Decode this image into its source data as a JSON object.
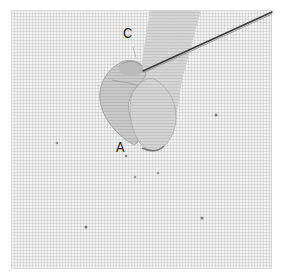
{
  "image": {
    "description": "Ribbon embroidery step: ribbon looped on fabric with needle inserted near point C",
    "width": 283,
    "height": 275
  },
  "labels": {
    "c": "C",
    "a": "A"
  },
  "colors": {
    "fabric": "#f3f3f3",
    "ribbon": "#c4c4c4",
    "ribbon_shadow": "#9a9a9a",
    "needle": "#3a3a3a",
    "label": "#1a1a1a",
    "dot": "#8a8a8a"
  },
  "marker_dots": [
    {
      "x": 57,
      "y": 143
    },
    {
      "x": 126,
      "y": 156
    },
    {
      "x": 135,
      "y": 177
    },
    {
      "x": 158,
      "y": 173
    },
    {
      "x": 216,
      "y": 115
    },
    {
      "x": 202,
      "y": 218
    },
    {
      "x": 86,
      "y": 227
    }
  ]
}
